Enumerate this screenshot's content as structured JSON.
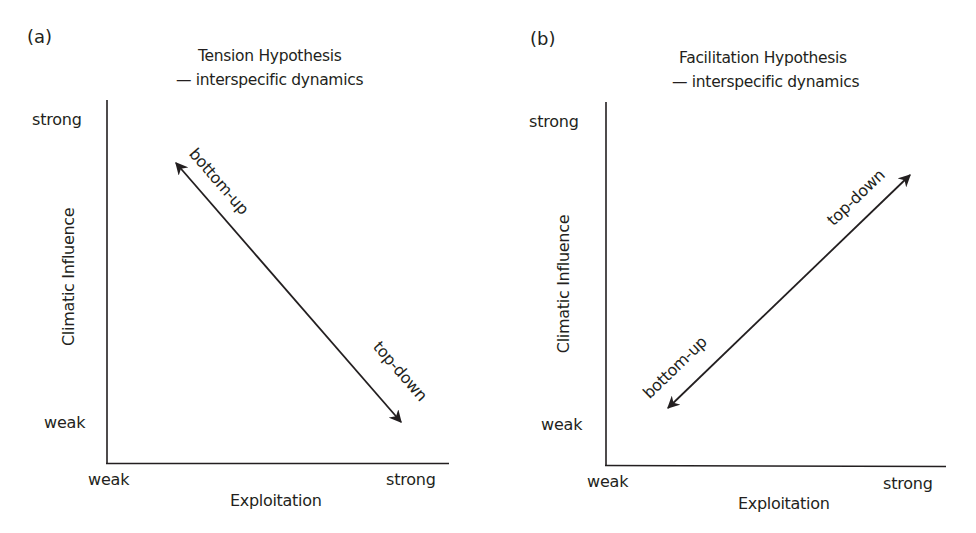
{
  "panels": [
    {
      "label": "(a)",
      "title_line1": "Tension Hypothesis",
      "title_line2": "— interspecific dynamics",
      "y_axis": {
        "title": "Climatic Influence",
        "tick_high": "strong",
        "tick_low": "weak"
      },
      "x_axis": {
        "title": "Exploitation",
        "tick_low": "weak",
        "tick_high": "strong"
      },
      "arrow": {
        "start_label": "bottom-up",
        "end_label": "top-down",
        "direction": "negative slope: high climate/low exploitation to low climate/high exploitation"
      }
    },
    {
      "label": "(b)",
      "title_line1": "Facilitation Hypothesis",
      "title_line2": "— interspecific dynamics",
      "y_axis": {
        "title": "Climatic Influence",
        "tick_high": "strong",
        "tick_low": "weak"
      },
      "x_axis": {
        "title": "Exploitation",
        "tick_low": "weak",
        "tick_high": "strong"
      },
      "arrow": {
        "start_label": "bottom-up",
        "end_label": "top-down",
        "direction": "positive slope: low climate/low exploitation to high climate/high exploitation"
      }
    }
  ],
  "colors": {
    "ink": "#231f20",
    "background": "#ffffff"
  }
}
